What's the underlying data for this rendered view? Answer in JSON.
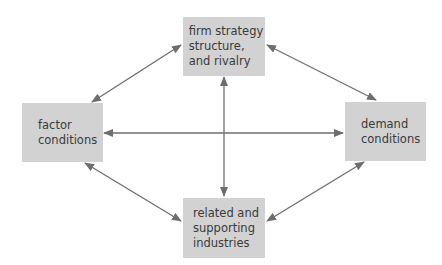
{
  "diagram": {
    "boxes": {
      "top": {
        "label": "firm strategy\nstructure,\nand rivalry"
      },
      "left": {
        "label": "factor\nconditions"
      },
      "right": {
        "label": "demand\nconditions"
      },
      "bottom": {
        "label": "related and\nsupporting\nindustries"
      }
    },
    "colors": {
      "box_fill": "#d2d2d2",
      "arrow": "#6e6e6e",
      "text": "#3a3a3a"
    },
    "connections": [
      {
        "from": "left",
        "to": "top",
        "type": "bidirectional"
      },
      {
        "from": "top",
        "to": "right",
        "type": "bidirectional"
      },
      {
        "from": "left",
        "to": "bottom",
        "type": "bidirectional"
      },
      {
        "from": "bottom",
        "to": "right",
        "type": "bidirectional"
      },
      {
        "from": "left",
        "to": "right",
        "type": "bidirectional"
      },
      {
        "from": "top",
        "to": "bottom",
        "type": "bidirectional"
      }
    ]
  }
}
